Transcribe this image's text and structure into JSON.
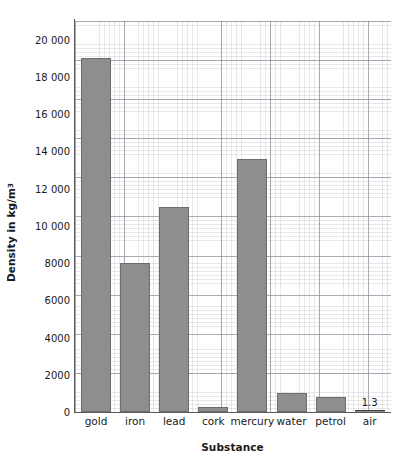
{
  "chart_data": {
    "type": "bar",
    "title": "",
    "xlabel": "Substance",
    "ylabel": "Density in kg/m",
    "ylabel_superscript": "3",
    "categories": [
      "gold",
      "iron",
      "lead",
      "cork",
      "mercury",
      "water",
      "petrol",
      "air"
    ],
    "values": [
      19000,
      8000,
      11000,
      250,
      13600,
      1000,
      800,
      1.3
    ],
    "point_labels": [
      "",
      "",
      "",
      "",
      "",
      "",
      "",
      "1.3"
    ],
    "ylim": [
      0,
      21000
    ],
    "yticks": [
      0,
      2000,
      4000,
      6000,
      8000,
      10000,
      12000,
      14000,
      16000,
      18000,
      20000
    ],
    "ytick_labels": [
      "0",
      "2000",
      "4000",
      "6000",
      "8000",
      "10 000",
      "12 000",
      "14 000",
      "16 000",
      "18 000",
      "20 000"
    ],
    "grid": true,
    "grid_minor": true,
    "legend": false,
    "bar_color": "#8e8e8e",
    "bar_edge_color": "#6d6d6d",
    "axis_color": "#5b5b5b",
    "grid_color": "#9696a5",
    "text_color": "#1a1a1a"
  }
}
